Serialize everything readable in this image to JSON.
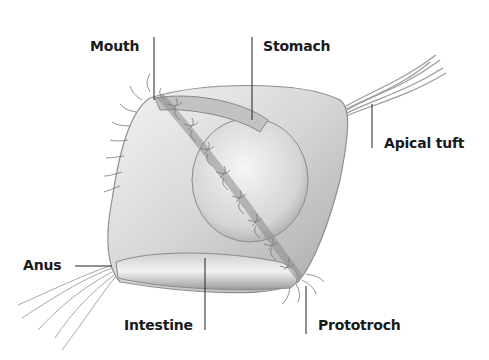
{
  "diagram": {
    "labels": [
      {
        "id": "mouth",
        "text": "Mouth"
      },
      {
        "id": "stomach",
        "text": "Stomach"
      },
      {
        "id": "apical-tuft",
        "text": "Apical tuft"
      },
      {
        "id": "anus",
        "text": "Anus"
      },
      {
        "id": "intestine",
        "text": "Intestine"
      },
      {
        "id": "prototroch",
        "text": "Prototroch"
      }
    ],
    "colors": {
      "body_light": "#eeeeee",
      "body_mid": "#c8c8c8",
      "body_dark": "#8a8a8a",
      "cilia": "#7a7a7a",
      "leader_line": "#222222",
      "text": "#1a1a1a"
    }
  }
}
